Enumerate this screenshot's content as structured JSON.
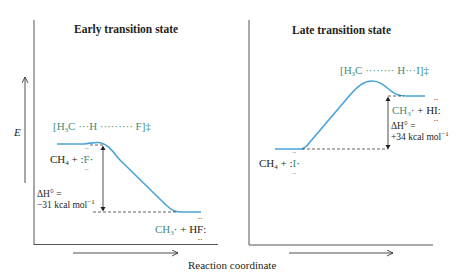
{
  "figure": {
    "y_axis_label": "E",
    "x_axis_label": "Reaction coordinate",
    "colors": {
      "curve": "#4aa3d8",
      "green_text": "#3f8f78",
      "axis": "#231f20"
    }
  },
  "panels": [
    {
      "title": "Early transition state",
      "transition_state": {
        "prefix": "[H",
        "sub": "3",
        "body": "C ···H ········· F]",
        "suffix": "‡"
      },
      "reactants": {
        "main": "CH",
        "sub": "4",
        "rest": " + :",
        "radical": "F",
        "tail": "·"
      },
      "products": {
        "main": "CH",
        "sub": "3",
        "rest": "· + H",
        "atom": "F",
        "tail": ":"
      },
      "delta_h": {
        "line1": "ΔH° =",
        "value": "−31 kcal mol",
        "sup": "−1"
      }
    },
    {
      "title": "Late transition state",
      "transition_state": {
        "prefix": "[H",
        "sub": "3",
        "body": "C ········ H···I]",
        "suffix": "‡"
      },
      "reactants": {
        "main": "CH",
        "sub": "4",
        "rest": " + :",
        "radical": "I",
        "tail": "·"
      },
      "products": {
        "main": "CH",
        "sub": "3",
        "rest": "· + H",
        "atom": "I",
        "tail": ":"
      },
      "delta_h": {
        "line1": "ΔH° =",
        "value": "+34 kcal mol",
        "sup": "−1"
      }
    }
  ]
}
